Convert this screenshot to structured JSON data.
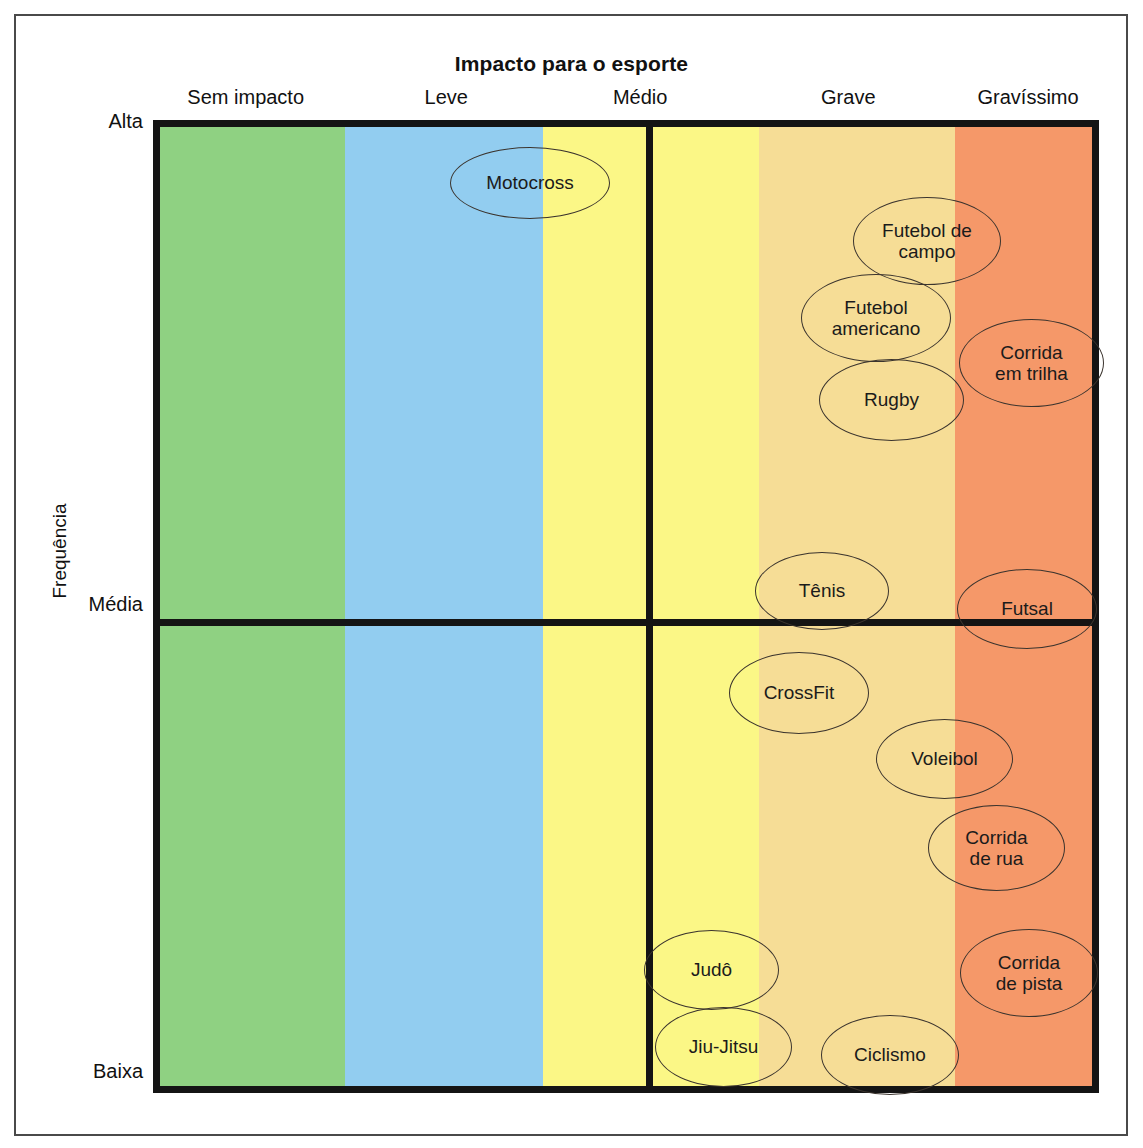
{
  "chart_data": {
    "type": "scatter",
    "title": "Impacto para o esporte",
    "xlabel": "Impacto para o esporte",
    "ylabel": "Frequência",
    "x_categories": [
      "Sem impacto",
      "Leve",
      "Médio",
      "Grave",
      "Gravíssimo"
    ],
    "y_categories": [
      "Alta",
      "Média",
      "Baixa"
    ],
    "grid": false,
    "legend": "none",
    "band_colors": [
      "#8fd182",
      "#92cdf0",
      "#fbf786",
      "#fbf786",
      "#f6dd96",
      "#f59869"
    ],
    "items": [
      {
        "label": "Motocross",
        "impact": "Leve-Médio",
        "frequency": "Alta"
      },
      {
        "label": "Futebol de campo",
        "impact": "Grave-Gravíssimo",
        "frequency": "Alta"
      },
      {
        "label": "Futebol americano",
        "impact": "Grave",
        "frequency": "Alta"
      },
      {
        "label": "Corrida em trilha",
        "impact": "Gravíssimo",
        "frequency": "Alta"
      },
      {
        "label": "Rugby",
        "impact": "Grave",
        "frequency": "Alta"
      },
      {
        "label": "Tênis",
        "impact": "Grave",
        "frequency": "Média"
      },
      {
        "label": "Futsal",
        "impact": "Gravíssimo",
        "frequency": "Média"
      },
      {
        "label": "CrossFit",
        "impact": "Grave",
        "frequency": "Média-Baixa"
      },
      {
        "label": "Voleibol",
        "impact": "Grave-Gravíssimo",
        "frequency": "Média-Baixa"
      },
      {
        "label": "Corrida de rua",
        "impact": "Gravíssimo",
        "frequency": "Média-Baixa"
      },
      {
        "label": "Corrida de pista",
        "impact": "Gravíssimo",
        "frequency": "Baixa"
      },
      {
        "label": "Judô",
        "impact": "Grave",
        "frequency": "Baixa"
      },
      {
        "label": "Jiu-Jitsu",
        "impact": "Grave",
        "frequency": "Baixa"
      },
      {
        "label": "Ciclismo",
        "impact": "Grave",
        "frequency": "Baixa"
      }
    ]
  },
  "header": {
    "title": "Impacto para o esporte"
  },
  "x_axis": {
    "labels": [
      {
        "text": "Sem impacto",
        "center_pct": 9.8
      },
      {
        "text": "Leve",
        "center_pct": 31.0
      },
      {
        "text": "Médio",
        "center_pct": 51.5
      },
      {
        "text": "Grave",
        "center_pct": 73.5
      },
      {
        "text": "Gravíssimo",
        "center_pct": 92.5
      }
    ]
  },
  "y_axis": {
    "title": "Frequência",
    "ticks": [
      {
        "text": "Alta",
        "top": 110
      },
      {
        "text": "Média",
        "top": 593
      },
      {
        "text": "Baixa",
        "top": 1060
      }
    ]
  },
  "bands": [
    {
      "name": "sem-impacto",
      "color": "#8fd182",
      "left": 0,
      "width": 19.8
    },
    {
      "name": "leve",
      "color": "#92cdf0",
      "left": 19.8,
      "width": 21.3
    },
    {
      "name": "medio-left",
      "color": "#fbf786",
      "left": 41.1,
      "width": 11.7
    },
    {
      "name": "medio-right",
      "color": "#fbf786",
      "left": 52.8,
      "width": 11.5
    },
    {
      "name": "grave",
      "color": "#f6dd96",
      "left": 64.3,
      "width": 21.0
    },
    {
      "name": "gravissimo",
      "color": "#f59869",
      "left": 85.3,
      "width": 14.7
    }
  ],
  "dividers": {
    "vertical_left_pct": 52.1,
    "horizontal_top_pct": 51.3
  },
  "bubbles": [
    {
      "name": "motocross",
      "label": "Motocross",
      "left": 443,
      "top": 140,
      "w": 160,
      "h": 72,
      "font": 19
    },
    {
      "name": "futebol-de-campo",
      "label": "Futebol de\ncampo",
      "left": 846,
      "top": 190,
      "w": 148,
      "h": 88,
      "font": 19
    },
    {
      "name": "futebol-americano",
      "label": "Futebol\namericano",
      "left": 794,
      "top": 267,
      "w": 150,
      "h": 88,
      "font": 19
    },
    {
      "name": "corrida-em-trilha",
      "label": "Corrida\nem trilha",
      "left": 952,
      "top": 312,
      "w": 145,
      "h": 88,
      "font": 19
    },
    {
      "name": "rugby",
      "label": "Rugby",
      "left": 812,
      "top": 352,
      "w": 145,
      "h": 82,
      "font": 19
    },
    {
      "name": "tenis",
      "label": "Tênis",
      "left": 748,
      "top": 545,
      "w": 134,
      "h": 78,
      "font": 19
    },
    {
      "name": "futsal",
      "label": "Futsal",
      "left": 950,
      "top": 562,
      "w": 140,
      "h": 80,
      "font": 19
    },
    {
      "name": "crossfit",
      "label": "CrossFit",
      "left": 722,
      "top": 645,
      "w": 140,
      "h": 82,
      "font": 19
    },
    {
      "name": "voleibol",
      "label": "Voleibol",
      "left": 869,
      "top": 712,
      "w": 137,
      "h": 80,
      "font": 19
    },
    {
      "name": "corrida-de-rua",
      "label": "Corrida\nde rua",
      "left": 921,
      "top": 798,
      "w": 137,
      "h": 86,
      "font": 19
    },
    {
      "name": "corrida-de-pista",
      "label": "Corrida\nde pista",
      "left": 953,
      "top": 922,
      "w": 138,
      "h": 88,
      "font": 19
    },
    {
      "name": "judo",
      "label": "Judô",
      "left": 637,
      "top": 923,
      "w": 135,
      "h": 80,
      "font": 19
    },
    {
      "name": "jiu-jitsu",
      "label": "Jiu-Jitsu",
      "left": 648,
      "top": 1000,
      "w": 137,
      "h": 80,
      "font": 19
    },
    {
      "name": "ciclismo",
      "label": "Ciclismo",
      "left": 814,
      "top": 1008,
      "w": 138,
      "h": 80,
      "font": 19
    }
  ]
}
